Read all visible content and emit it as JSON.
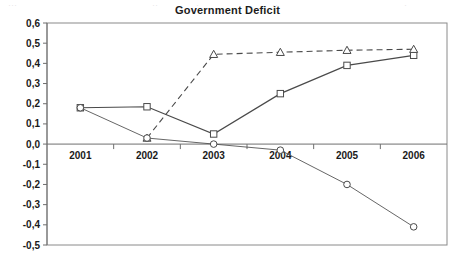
{
  "chart_data": {
    "type": "line",
    "title": "Government Deficit",
    "xlabel": "",
    "ylabel": "",
    "x": [
      "2001",
      "2002",
      "2003",
      "2004",
      "2005",
      "2006"
    ],
    "categories": [
      "2001",
      "2002",
      "2003",
      "2004",
      "2005",
      "2006"
    ],
    "ylim": [
      -0.5,
      0.6
    ],
    "ytick_labels": [
      "0,6",
      "0,5",
      "0,4",
      "0,3",
      "0,2",
      "0,1",
      "0,0",
      "-0,1",
      "-0,2",
      "-0,3",
      "-0,4",
      "-0,5"
    ],
    "ytick_values": [
      0.6,
      0.5,
      0.4,
      0.3,
      0.2,
      0.1,
      0.0,
      -0.1,
      -0.2,
      -0.3,
      -0.4,
      -0.5
    ],
    "xtick_labels": [
      "2001",
      "2002",
      "2003",
      "2004",
      "2005",
      "2006"
    ],
    "grid": false,
    "legend": "none",
    "decimal_separator": ",",
    "series": [
      {
        "name": "square-solid-series",
        "marker": "square",
        "linestyle": "solid",
        "x": [
          "2001",
          "2002",
          "2003",
          "2004",
          "2005",
          "2006"
        ],
        "values": [
          0.18,
          0.185,
          0.05,
          0.25,
          0.39,
          0.44
        ]
      },
      {
        "name": "triangle-dashed-series",
        "marker": "triangle",
        "linestyle": "dashed",
        "x": [
          "2002",
          "2003",
          "2004",
          "2005",
          "2006"
        ],
        "values": [
          0.03,
          0.445,
          0.455,
          0.465,
          0.47
        ]
      },
      {
        "name": "circle-thin-series",
        "marker": "circle",
        "linestyle": "thin",
        "x": [
          "2001",
          "2002",
          "2003",
          "2004",
          "2005",
          "2006"
        ],
        "values": [
          0.18,
          0.03,
          0.0,
          -0.03,
          -0.2,
          -0.41
        ]
      }
    ]
  },
  "artifacts": {
    "top_row_fragments": [
      {
        "text": "···",
        "left": 8
      },
      {
        "text": "··",
        "left": 152
      },
      {
        "text": "·",
        "left": 196
      },
      {
        "text": "··",
        "left": 272
      },
      {
        "text": "·",
        "left": 404
      }
    ]
  }
}
